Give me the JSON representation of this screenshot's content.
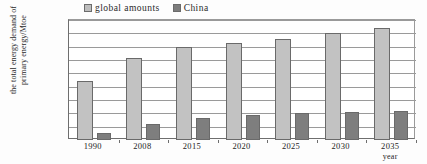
{
  "legend": {
    "items": [
      {
        "label": "global amounts",
        "icon": "square-swatch-light",
        "color": "#c2c2c2"
      },
      {
        "label": "China",
        "icon": "square-swatch-dark",
        "color": "#7e7e7e"
      }
    ]
  },
  "axes": {
    "ylabel_line1": "the total energy demand of",
    "ylabel_line2": "primary energy/Mtoe",
    "xlabel": "year",
    "yticks": [
      "18,000",
      "16,000",
      "14,000",
      "12,000",
      "10,000",
      "8000",
      "6000",
      "4000",
      "2000",
      "0"
    ]
  },
  "chart_data": {
    "type": "bar",
    "title": "",
    "xlabel": "year",
    "ylabel": "the total energy demand of primary energy/Mtoe",
    "categories": [
      "1990",
      "2008",
      "2015",
      "2020",
      "2025",
      "2030",
      "2035"
    ],
    "series": [
      {
        "name": "global amounts",
        "color": "#c2c2c2",
        "values": [
          8800,
          12300,
          14000,
          14600,
          15200,
          16000,
          16800
        ]
      },
      {
        "name": "China",
        "color": "#7e7e7e",
        "values": [
          1000,
          2400,
          3300,
          3800,
          4000,
          4200,
          4400
        ]
      }
    ],
    "ylim": [
      0,
      18000
    ],
    "ytick_values": [
      18000,
      16000,
      14000,
      12000,
      10000,
      8000,
      6000,
      4000,
      2000,
      0
    ],
    "grid": true,
    "legend_position": "top-center"
  }
}
